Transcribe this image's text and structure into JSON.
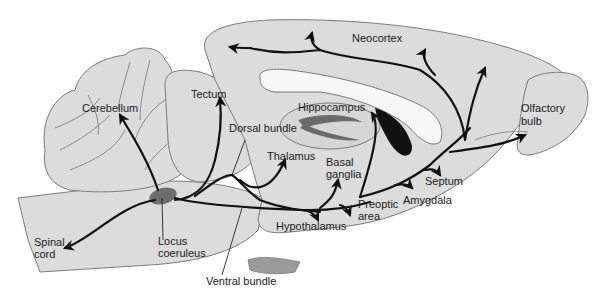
{
  "figure": {
    "type": "sagittal brain section diagram"
  },
  "colors": {
    "tissue": "#dcdcdc",
    "outline": "#7a7a7a",
    "pathway": "#111111",
    "locus_coeruleus": "#6e6e6e",
    "ventricle_dark": "#111111",
    "ventricle_light": "#f7f7f7"
  },
  "labels": {
    "neocortex": "Neocortex",
    "cerebellum": "Cerebellum",
    "tectum": "Tectum",
    "hippocampus": "Hippocampus",
    "olfactory_bulb_1": "Olfactory",
    "olfactory_bulb_2": "bulb",
    "dorsal_bundle": "Dorsal bundle",
    "thalamus": "Thalamus",
    "basal_ganglia_1": "Basal",
    "basal_ganglia_2": "ganglia",
    "septum": "Septum",
    "amygdala": "Amygdala",
    "preoptic_area_1": "Preoptic",
    "preoptic_area_2": "area",
    "hypothalamus": "Hypothalamus",
    "spinal_cord_1": "Spinal",
    "spinal_cord_2": "cord",
    "locus_coeruleus_1": "Locus",
    "locus_coeruleus_2": "coeruleus",
    "ventral_bundle": "Ventral bundle"
  }
}
